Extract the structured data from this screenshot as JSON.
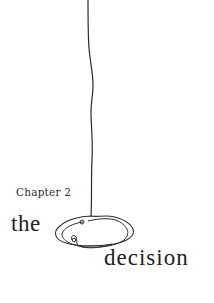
{
  "page": {
    "chapter_label": "Chapter 2",
    "title_part_1": "the",
    "title_part_2": "decision"
  },
  "illustration": {
    "description": "hand-drawn hanging line ending in a tangled scribble loop",
    "stroke_color": "#2b2b2b"
  },
  "colors": {
    "background": "#ffffff",
    "text": "#1e1e1e"
  }
}
